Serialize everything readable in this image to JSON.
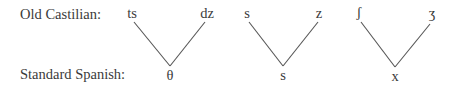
{
  "rows": {
    "top_label": "Old Castilian:",
    "bottom_label": "Standard Spanish:"
  },
  "groups": [
    {
      "left": "ts",
      "right": "dz",
      "result": "θ"
    },
    {
      "left": "s",
      "right": "z",
      "result": "s"
    },
    {
      "left": "ʃ",
      "right": "ʒ",
      "result": "x"
    }
  ],
  "colors": {
    "text": "#3a3a3a",
    "line": "#555555",
    "background": "#ffffff"
  }
}
